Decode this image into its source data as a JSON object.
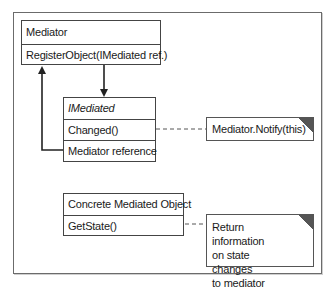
{
  "diagram": {
    "type": "uml-class",
    "classes": {
      "mediator": {
        "name": "Mediator",
        "members": [
          "RegisterObject(IMediated ref.)"
        ]
      },
      "imediated": {
        "name": "IMediated",
        "name_style": "italic",
        "members": [
          "Changed()",
          "Mediator reference"
        ]
      },
      "concrete": {
        "name": "Concrete Mediated Object",
        "members": [
          "GetState()"
        ]
      }
    },
    "notes": {
      "notify": {
        "text": "Mediator.Notify(this)"
      },
      "state": {
        "line1": "Return information",
        "line2": "on state changes",
        "line3": "to mediator"
      }
    },
    "relations": [
      {
        "from": "Mediator",
        "to": "IMediated",
        "kind": "association-arrow"
      },
      {
        "from": "IMediated.Mediator reference",
        "to": "Mediator",
        "kind": "association-arrow"
      },
      {
        "from": "IMediated.Changed()",
        "to": "note.notify",
        "kind": "dashed-note-link"
      },
      {
        "from": "Concrete Mediated Object.GetState()",
        "to": "note.state",
        "kind": "dashed-note-link"
      }
    ],
    "colors": {
      "line": "#444444",
      "frame": "#6b6b6b",
      "note_fold": "#555555"
    }
  }
}
